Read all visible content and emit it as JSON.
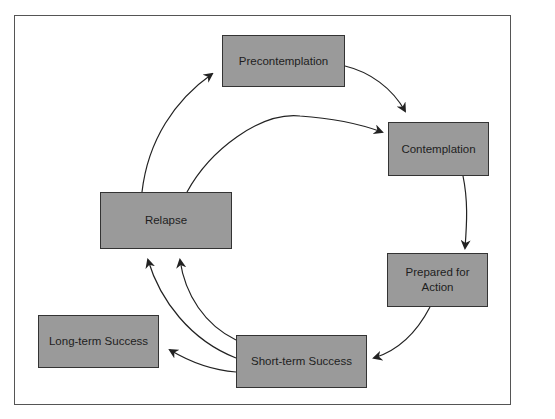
{
  "diagram": {
    "type": "cycle-flowchart",
    "nodes": [
      {
        "id": "precontemplation",
        "label": "Precontemplation"
      },
      {
        "id": "contemplation",
        "label": "Contemplation"
      },
      {
        "id": "prepared",
        "label": "Prepared for Action"
      },
      {
        "id": "short_term",
        "label": "Short-term Success"
      },
      {
        "id": "long_term",
        "label": "Long-term Success"
      },
      {
        "id": "relapse",
        "label": "Relapse"
      }
    ],
    "edges": [
      {
        "from": "precontemplation",
        "to": "contemplation"
      },
      {
        "from": "contemplation",
        "to": "prepared"
      },
      {
        "from": "prepared",
        "to": "short_term"
      },
      {
        "from": "short_term",
        "to": "long_term"
      },
      {
        "from": "short_term",
        "to": "relapse"
      },
      {
        "from": "short_term",
        "to": "relapse"
      },
      {
        "from": "relapse",
        "to": "precontemplation"
      },
      {
        "from": "relapse",
        "to": "contemplation"
      }
    ],
    "colors": {
      "box_fill": "#9a9a9a",
      "box_border": "#333333",
      "arrow": "#222222",
      "frame": "#555555"
    }
  },
  "labels": {
    "precontemplation": "Precontemplation",
    "contemplation": "Contemplation",
    "prepared_line1": "Prepared for",
    "prepared_line2": "Action",
    "relapse": "Relapse",
    "short_term": "Short-term Success",
    "long_term": "Long-term Success"
  }
}
